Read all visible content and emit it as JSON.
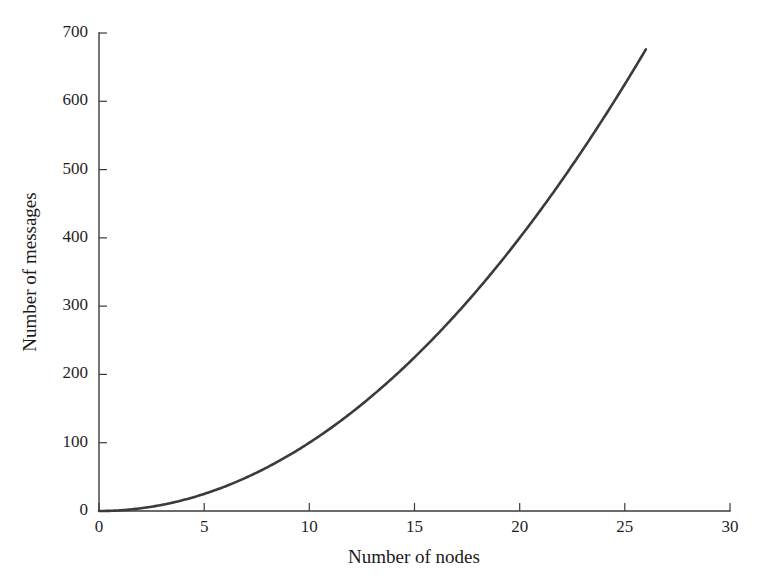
{
  "chart_data": {
    "type": "line",
    "title": "",
    "xlabel": "Number of nodes",
    "ylabel": "Number of messages",
    "xlim": [
      0,
      30
    ],
    "ylim": [
      0,
      700
    ],
    "xticks": [
      0,
      5,
      10,
      15,
      20,
      25,
      30
    ],
    "yticks": [
      0,
      100,
      200,
      300,
      400,
      500,
      600,
      700
    ],
    "xtick_labels": [
      "0",
      "5",
      "10",
      "15",
      "20",
      "25",
      "30"
    ],
    "ytick_labels": [
      "0",
      "100",
      "200",
      "300",
      "400",
      "500",
      "600",
      "700"
    ],
    "grid": false,
    "legend": null,
    "line_color": "#3b3b3b",
    "background_color": "#ffffff",
    "axis_color": "#3a3a3a",
    "series": [
      {
        "name": "Number of messages",
        "relation": "y = n^2",
        "x": [
          0,
          1,
          2,
          3,
          4,
          5,
          6,
          7,
          8,
          9,
          10,
          11,
          12,
          13,
          14,
          15,
          16,
          17,
          18,
          19,
          20,
          21,
          22,
          23,
          24,
          25,
          26
        ],
        "values": [
          0,
          1,
          4,
          9,
          16,
          25,
          36,
          49,
          64,
          81,
          100,
          121,
          144,
          169,
          196,
          225,
          256,
          289,
          324,
          361,
          400,
          441,
          484,
          529,
          576,
          625,
          676
        ]
      }
    ]
  }
}
